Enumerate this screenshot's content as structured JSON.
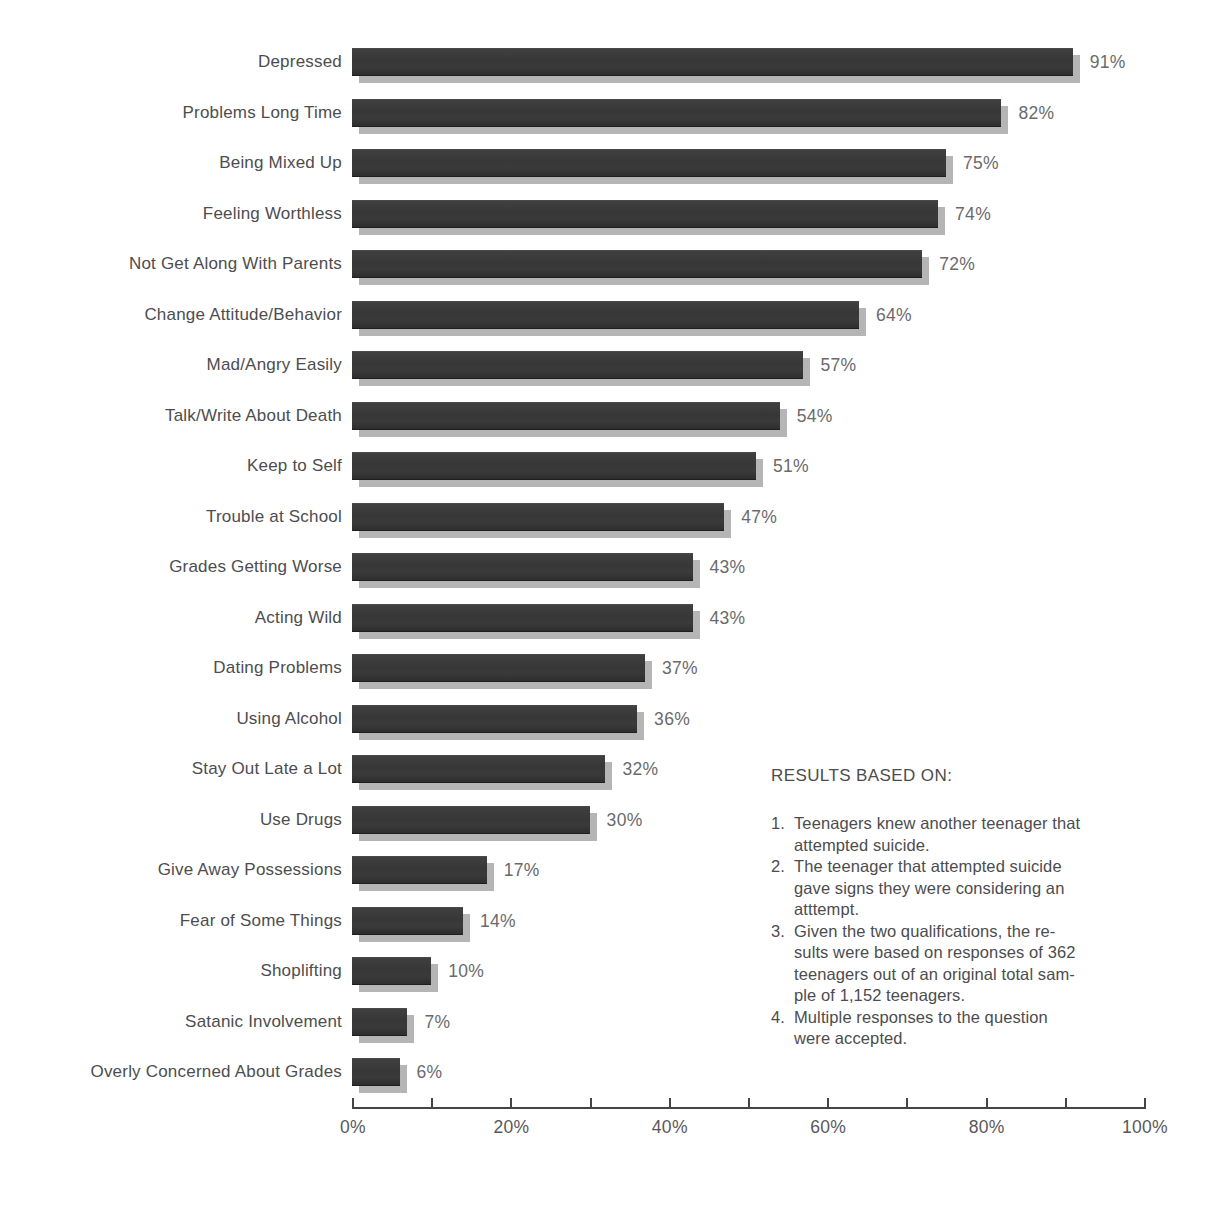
{
  "chart_data": {
    "type": "bar",
    "orientation": "horizontal",
    "title": "",
    "categories": [
      "Depressed",
      "Problems Long Time",
      "Being Mixed Up",
      "Feeling Worthless",
      "Not Get Along With Parents",
      "Change Attitude/Behavior",
      "Mad/Angry Easily",
      "Talk/Write About Death",
      "Keep to Self",
      "Trouble at School",
      "Grades Getting Worse",
      "Acting Wild",
      "Dating Problems",
      "Using Alcohol",
      "Stay Out Late a Lot",
      "Use Drugs",
      "Give Away Possessions",
      "Fear of Some Things",
      "Shoplifting",
      "Satanic Involvement",
      "Overly Concerned About Grades"
    ],
    "values": [
      91,
      82,
      75,
      74,
      72,
      64,
      57,
      54,
      51,
      47,
      43,
      43,
      37,
      36,
      32,
      30,
      17,
      14,
      10,
      7,
      6
    ],
    "value_labels": [
      "91%",
      "82%",
      "75%",
      "74%",
      "72%",
      "64%",
      "57%",
      "54%",
      "51%",
      "47%",
      "43%",
      "43%",
      "37%",
      "36%",
      "32%",
      "30%",
      "17%",
      "14%",
      "10%",
      "7%",
      "6%"
    ],
    "xlabel": "",
    "ylabel": "",
    "xlim": [
      0,
      100
    ],
    "x_axis": {
      "tick_interval": 10,
      "labels": [
        {
          "value": 0,
          "text": "0%"
        },
        {
          "value": 20,
          "text": "20%"
        },
        {
          "value": 40,
          "text": "40%"
        },
        {
          "value": 60,
          "text": "60%"
        },
        {
          "value": 80,
          "text": "80%"
        },
        {
          "value": 100,
          "text": "100%"
        }
      ]
    },
    "grid": false,
    "legend": false
  },
  "colors": {
    "bar_fill": "#3a3a3a",
    "bar_shadow": "#b5b5b5",
    "category_text": "#4d4d4f",
    "value_text": "#6a6a6c",
    "axis": "#454547",
    "background": "#ffffff"
  },
  "notes": {
    "title": "RESULTS BASED ON:",
    "items": [
      {
        "number": "1.",
        "lines": [
          "Teenagers knew another teenager that",
          "attempted suicide."
        ]
      },
      {
        "number": "2.",
        "lines": [
          "The teenager that attempted suicide",
          "gave signs they were considering an",
          "atttempt."
        ]
      },
      {
        "number": "3.",
        "lines": [
          "Given the two qualifications, the re-",
          "sults were based on responses of 362",
          "teenagers out of an original total sam-",
          "ple of 1,152 teenagers."
        ]
      },
      {
        "number": "4.",
        "lines": [
          "Multiple responses to the question",
          "were accepted."
        ]
      }
    ]
  }
}
